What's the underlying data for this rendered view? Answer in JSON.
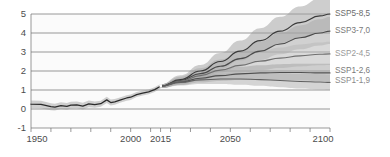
{
  "chart_data": {
    "type": "line",
    "title": "",
    "subtitle": "",
    "xlabel": "",
    "ylabel": "",
    "xlim": [
      1950,
      2100
    ],
    "ylim": [
      -1,
      5
    ],
    "grid": true,
    "legend_position": "right-inline",
    "x_ticks_labeled": [
      "1950",
      "2000",
      "2015",
      "2050",
      "2100"
    ],
    "x_ticks_labeled_values": [
      1950,
      2000,
      2015,
      2050,
      2100
    ],
    "x_tick_interval": 10,
    "y_ticks": [
      "-1",
      "0",
      "1",
      "2",
      "3",
      "4",
      "5"
    ],
    "y_tick_values": [
      -1,
      0,
      1,
      2,
      3,
      4,
      5
    ],
    "historical": {
      "name": "historical",
      "color": "#2b2b2b",
      "band_color": "#9a9a9a",
      "x": [
        1950,
        1955,
        1960,
        1962,
        1965,
        1968,
        1970,
        1973,
        1976,
        1979,
        1982,
        1985,
        1988,
        1990,
        1992,
        1995,
        1998,
        2000,
        2003,
        2006,
        2009,
        2012,
        2015
      ],
      "values": [
        0.25,
        0.24,
        0.12,
        0.1,
        0.18,
        0.14,
        0.2,
        0.22,
        0.15,
        0.27,
        0.23,
        0.28,
        0.48,
        0.34,
        0.38,
        0.48,
        0.58,
        0.62,
        0.76,
        0.84,
        0.9,
        1.02,
        1.2
      ],
      "band_lower": [
        0.05,
        0.04,
        -0.06,
        -0.08,
        0.0,
        -0.04,
        0.02,
        0.04,
        -0.03,
        0.09,
        0.07,
        0.12,
        0.32,
        0.18,
        0.23,
        0.34,
        0.44,
        0.48,
        0.63,
        0.71,
        0.78,
        0.9,
        1.08
      ],
      "band_upper": [
        0.45,
        0.44,
        0.3,
        0.28,
        0.36,
        0.32,
        0.38,
        0.4,
        0.33,
        0.45,
        0.39,
        0.44,
        0.64,
        0.5,
        0.53,
        0.62,
        0.72,
        0.76,
        0.89,
        0.97,
        1.02,
        1.14,
        1.32
      ]
    },
    "series": [
      {
        "name": "SSP5-8,5",
        "label": "SSP5-8,5",
        "color": "#6b6b6b",
        "line_color": "#3a3a3a",
        "band_color": "#9d9d9d",
        "x": [
          2015,
          2025,
          2035,
          2045,
          2055,
          2065,
          2075,
          2085,
          2095,
          2100
        ],
        "values": [
          1.2,
          1.55,
          2.0,
          2.5,
          3.05,
          3.6,
          4.1,
          4.55,
          4.9,
          5.0
        ],
        "band_lower": [
          1.1,
          1.35,
          1.7,
          2.1,
          2.55,
          3.0,
          3.4,
          3.75,
          4.05,
          4.15
        ],
        "band_upper": [
          1.3,
          1.78,
          2.32,
          2.95,
          3.6,
          4.25,
          4.85,
          5.4,
          5.82,
          5.95
        ],
        "end_value": 5.0,
        "label_y": 5.0
      },
      {
        "name": "SSP3-7,0",
        "label": "SSP3-7,0",
        "color": "#787878",
        "line_color": "#4a4a4a",
        "band_color": "#a7a7a7",
        "x": [
          2015,
          2025,
          2035,
          2045,
          2055,
          2065,
          2075,
          2085,
          2095,
          2100
        ],
        "values": [
          1.2,
          1.5,
          1.86,
          2.25,
          2.65,
          3.05,
          3.42,
          3.75,
          4.0,
          4.1
        ],
        "band_lower": [
          1.1,
          1.32,
          1.6,
          1.92,
          2.25,
          2.58,
          2.88,
          3.14,
          3.34,
          3.42
        ],
        "band_upper": [
          1.3,
          1.7,
          2.14,
          2.6,
          3.08,
          3.55,
          4.0,
          4.4,
          4.72,
          4.84
        ],
        "end_value": 4.1,
        "label_y": 4.1
      },
      {
        "name": "SSP2-4,5",
        "label": "SSP2-4,5",
        "color": "#999999",
        "line_color": "#6f6f6f",
        "band_color": "#b8b8b8",
        "x": [
          2015,
          2025,
          2035,
          2045,
          2055,
          2065,
          2075,
          2085,
          2095,
          2100
        ],
        "values": [
          1.2,
          1.46,
          1.76,
          2.05,
          2.3,
          2.52,
          2.68,
          2.8,
          2.88,
          2.9
        ],
        "band_lower": [
          1.1,
          1.28,
          1.5,
          1.72,
          1.9,
          2.05,
          2.16,
          2.24,
          2.3,
          2.32
        ],
        "band_upper": [
          1.3,
          1.64,
          2.04,
          2.42,
          2.74,
          3.02,
          3.24,
          3.4,
          3.5,
          3.54
        ],
        "end_value": 2.9,
        "label_y": 2.9
      },
      {
        "name": "SSP1-2,6",
        "label": "SSP1-2,6",
        "color": "#7a7a7a",
        "line_color": "#4f4f4f",
        "band_color": "#a2a2a2",
        "x": [
          2015,
          2025,
          2035,
          2045,
          2055,
          2065,
          2075,
          2085,
          2095,
          2100
        ],
        "values": [
          1.2,
          1.42,
          1.62,
          1.76,
          1.85,
          1.9,
          1.92,
          1.92,
          1.9,
          1.9
        ],
        "band_lower": [
          1.1,
          1.26,
          1.4,
          1.48,
          1.52,
          1.53,
          1.52,
          1.5,
          1.47,
          1.46
        ],
        "band_upper": [
          1.3,
          1.6,
          1.88,
          2.08,
          2.22,
          2.3,
          2.36,
          2.38,
          2.38,
          2.38
        ],
        "end_value": 1.9,
        "label_y": 2.02
      },
      {
        "name": "SSP1-1,9",
        "label": "SSP1-1,9",
        "color": "#8a8a8a",
        "line_color": "#606060",
        "band_color": "#adadad",
        "x": [
          2015,
          2025,
          2035,
          2045,
          2055,
          2065,
          2075,
          2085,
          2095,
          2100
        ],
        "values": [
          1.2,
          1.4,
          1.53,
          1.58,
          1.58,
          1.55,
          1.5,
          1.45,
          1.42,
          1.4
        ],
        "band_lower": [
          1.1,
          1.24,
          1.32,
          1.32,
          1.28,
          1.22,
          1.15,
          1.08,
          1.03,
          1.0
        ],
        "band_upper": [
          1.3,
          1.57,
          1.76,
          1.86,
          1.9,
          1.9,
          1.88,
          1.85,
          1.83,
          1.82
        ],
        "end_value": 1.4,
        "label_y": 1.5
      }
    ]
  },
  "axes": {
    "x_labels": [
      {
        "value": 1950,
        "text": "1950"
      },
      {
        "value": 2000,
        "text": "2000"
      },
      {
        "value": 2015,
        "text": "2015"
      },
      {
        "value": 2050,
        "text": "2050"
      },
      {
        "value": 2100,
        "text": "2100"
      }
    ],
    "y_labels": [
      {
        "value": 5,
        "text": "5"
      },
      {
        "value": 4,
        "text": "4"
      },
      {
        "value": 3,
        "text": "3"
      },
      {
        "value": 2,
        "text": "2"
      },
      {
        "value": 1,
        "text": "1"
      },
      {
        "value": 0,
        "text": "0"
      },
      {
        "value": -1,
        "text": "-1"
      }
    ]
  },
  "colors": {
    "background": "#ffffff",
    "plot_background": "#fbfbfb",
    "grid": "#6e6e6e",
    "axis_text": "#4c4c4c",
    "label_text": "#6a6a6a",
    "historical_line": "#2b2b2b"
  }
}
